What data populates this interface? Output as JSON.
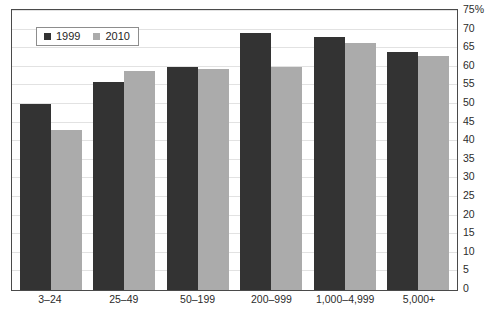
{
  "chart_data": {
    "type": "bar",
    "title": "",
    "xlabel": "",
    "ylabel": "",
    "ylim": [
      0,
      75
    ],
    "ytick_step": 5,
    "grid": true,
    "legend_position": "top-left",
    "categories": [
      "3–24",
      "25–49",
      "50–199",
      "200–999",
      "1,000–4,999",
      "5,000+"
    ],
    "ytick_labels": [
      "75%",
      "70",
      "65",
      "60",
      "55",
      "50",
      "45",
      "40",
      "35",
      "30",
      "25",
      "20",
      "15",
      "10",
      "5",
      "0"
    ],
    "ytick_values": [
      75,
      70,
      65,
      60,
      55,
      50,
      45,
      40,
      35,
      30,
      25,
      20,
      15,
      10,
      5,
      0
    ],
    "series": [
      {
        "name": "1999",
        "color": "#333333",
        "values": [
          50,
          56,
          60,
          69,
          68,
          64
        ]
      },
      {
        "name": "2010",
        "color": "#ababab",
        "values": [
          43,
          59,
          59.5,
          60,
          66.5,
          63
        ]
      }
    ]
  },
  "legend": {
    "items": [
      {
        "label": "1999",
        "color": "#333333"
      },
      {
        "label": "2010",
        "color": "#ababab"
      }
    ]
  },
  "axis": {
    "unit_suffix": "%"
  }
}
